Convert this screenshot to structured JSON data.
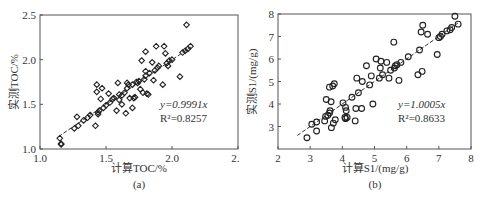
{
  "chart_data": [
    {
      "type": "scatter",
      "panel": "(a)",
      "caption": "(a)",
      "xlabel": "计算TOC/%",
      "ylabel": "实测TOC/%",
      "xlim": [
        1.0,
        2.5
      ],
      "ylim": [
        1.0,
        2.5
      ],
      "xticks": [
        "1.0",
        "1.5",
        "2.0",
        "2.5"
      ],
      "yticks": [
        "1.0",
        "1.5",
        "2.0",
        "2.5"
      ],
      "marker": "diamond",
      "grid": false,
      "fit": {
        "equation": "y=0.9991x",
        "r2": "R²=0.8257",
        "slope": 0.9991,
        "r2_value": 0.8257
      },
      "x": [
        1.15,
        1.16,
        1.16,
        1.26,
        1.28,
        1.29,
        1.33,
        1.36,
        1.38,
        1.42,
        1.43,
        1.43,
        1.44,
        1.44,
        1.45,
        1.46,
        1.47,
        1.48,
        1.5,
        1.52,
        1.53,
        1.55,
        1.56,
        1.58,
        1.59,
        1.6,
        1.6,
        1.62,
        1.62,
        1.64,
        1.65,
        1.66,
        1.66,
        1.67,
        1.68,
        1.7,
        1.7,
        1.71,
        1.72,
        1.73,
        1.74,
        1.75,
        1.76,
        1.77,
        1.78,
        1.79,
        1.8,
        1.8,
        1.8,
        1.81,
        1.82,
        1.83,
        1.85,
        1.86,
        1.87,
        1.88,
        1.89,
        1.9,
        1.93,
        1.94,
        1.95,
        1.96,
        1.97,
        1.98,
        2.0,
        2.06,
        2.08,
        2.1,
        2.11,
        2.12,
        2.14
      ],
      "y": [
        1.12,
        1.06,
        1.05,
        1.23,
        1.36,
        1.26,
        1.32,
        1.35,
        1.38,
        1.26,
        1.64,
        1.72,
        1.41,
        1.39,
        1.43,
        1.56,
        1.68,
        1.46,
        1.49,
        1.62,
        1.52,
        1.56,
        1.57,
        1.43,
        1.74,
        1.61,
        1.55,
        1.5,
        1.6,
        1.63,
        1.4,
        1.74,
        1.68,
        1.72,
        1.57,
        1.46,
        1.72,
        1.57,
        1.58,
        1.75,
        1.74,
        1.76,
        1.67,
        1.99,
        1.63,
        1.78,
        1.82,
        2.09,
        1.87,
        1.62,
        1.61,
        1.85,
        1.97,
        1.77,
        1.88,
        2.15,
        1.91,
        1.93,
        1.72,
        2.15,
        2.07,
        1.96,
        1.93,
        1.99,
        2.0,
        1.81,
        2.08,
        2.1,
        2.39,
        2.12,
        2.15
      ]
    },
    {
      "type": "scatter",
      "panel": "(b)",
      "caption": "(b)",
      "xlabel": "计算S1/(mg/g)",
      "ylabel": "实测S1/(mg/g)",
      "xlim": [
        2,
        8
      ],
      "ylim": [
        2,
        8
      ],
      "xticks": [
        "2",
        "3",
        "4",
        "5",
        "6",
        "7",
        "8"
      ],
      "yticks": [
        "3",
        "4",
        "5",
        "6",
        "7",
        "8"
      ],
      "marker": "circle",
      "grid": false,
      "fit": {
        "equation": "y=1.0005x",
        "r2": "R²=0.8633",
        "slope": 1.0005,
        "r2_value": 0.8633
      },
      "x": [
        2.9,
        3.05,
        3.2,
        3.2,
        3.45,
        3.48,
        3.5,
        3.55,
        3.6,
        3.6,
        3.62,
        3.65,
        3.66,
        3.7,
        3.72,
        3.75,
        3.78,
        4.02,
        4.08,
        4.1,
        4.1,
        4.12,
        4.15,
        4.3,
        4.4,
        4.42,
        4.45,
        4.5,
        4.6,
        4.62,
        4.75,
        4.85,
        4.9,
        4.95,
        5.05,
        5.15,
        5.18,
        5.2,
        5.25,
        5.38,
        5.45,
        5.5,
        5.6,
        5.62,
        5.65,
        5.7,
        5.76,
        5.82,
        6.05,
        6.35,
        6.4,
        6.45,
        6.48,
        6.5,
        6.65,
        6.95,
        7.0,
        7.05,
        7.1,
        7.25,
        7.35,
        7.4,
        7.5,
        7.6
      ],
      "y": [
        2.5,
        3.1,
        3.2,
        2.8,
        3.25,
        3.45,
        4.2,
        3.5,
        3.6,
        4.75,
        3.7,
        4.1,
        2.95,
        4.8,
        3.15,
        4.9,
        3.3,
        4.05,
        3.4,
        3.85,
        3.35,
        3.7,
        3.4,
        4.3,
        3.25,
        3.8,
        5.15,
        4.5,
        3.8,
        5.0,
        5.7,
        4.85,
        5.25,
        4.0,
        6.0,
        5.15,
        5.6,
        5.9,
        5.3,
        5.85,
        5.15,
        5.5,
        6.75,
        5.6,
        5.7,
        5.75,
        5.05,
        5.85,
        6.1,
        5.3,
        6.4,
        7.2,
        5.45,
        7.5,
        7.1,
        6.2,
        6.95,
        7.0,
        7.1,
        7.25,
        7.3,
        7.4,
        7.9,
        7.55
      ]
    }
  ]
}
